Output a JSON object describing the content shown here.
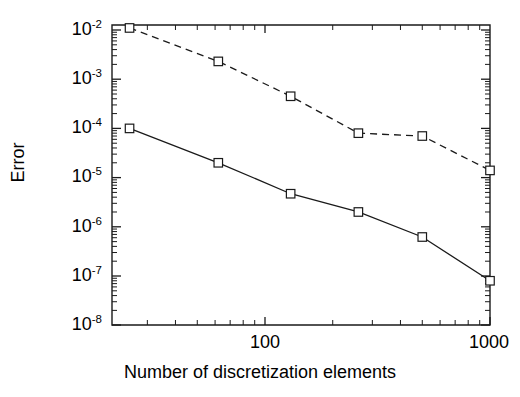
{
  "chart_data": {
    "type": "line",
    "title": "",
    "xlabel": "Number of discretization elements",
    "ylabel": "Error",
    "xscale": "log",
    "yscale": "log",
    "xlim": [
      20.8,
      1000
    ],
    "ylim": [
      1e-08,
      0.0126
    ],
    "grid": false,
    "legend": "none",
    "x_tick_labels": [
      "100",
      "1000"
    ],
    "x_tick_values": [
      100,
      1000
    ],
    "y_tick_labels": [
      "10⁻²",
      "10⁻³",
      "10⁻⁴",
      "10⁻⁵",
      "10⁻⁶",
      "10⁻⁷",
      "10⁻⁸"
    ],
    "y_tick_values": [
      0.01,
      0.001,
      0.0001,
      1e-05,
      1e-06,
      1e-07,
      1e-08
    ],
    "x": [
      25,
      62,
      130,
      260,
      500,
      1000
    ],
    "series": [
      {
        "name": "upper-curve-dashed",
        "style": "dashed",
        "marker": "square",
        "values": [
          0.011,
          0.0023,
          0.00045,
          8e-05,
          7e-05,
          1.4e-05
        ]
      },
      {
        "name": "lower-curve-solid",
        "style": "solid",
        "marker": "square",
        "values": [
          0.0001,
          2e-05,
          4.7e-06,
          2e-06,
          6.2e-07,
          8e-08
        ]
      }
    ],
    "colors": {
      "axis": "#1a1a1a",
      "series": "#1a1a1a",
      "marker_fill": "#ffffff",
      "background": "#ffffff"
    }
  },
  "axes": {
    "x_title": "Number of discretization elements",
    "y_title": "Error",
    "x_ticks": [
      {
        "label": "100"
      },
      {
        "label": "1000"
      }
    ],
    "y_ticks": [
      {
        "mantissa": "10",
        "exponent": "-2"
      },
      {
        "mantissa": "10",
        "exponent": "-3"
      },
      {
        "mantissa": "10",
        "exponent": "-4"
      },
      {
        "mantissa": "10",
        "exponent": "-5"
      },
      {
        "mantissa": "10",
        "exponent": "-6"
      },
      {
        "mantissa": "10",
        "exponent": "-7"
      },
      {
        "mantissa": "10",
        "exponent": "-8"
      }
    ]
  }
}
